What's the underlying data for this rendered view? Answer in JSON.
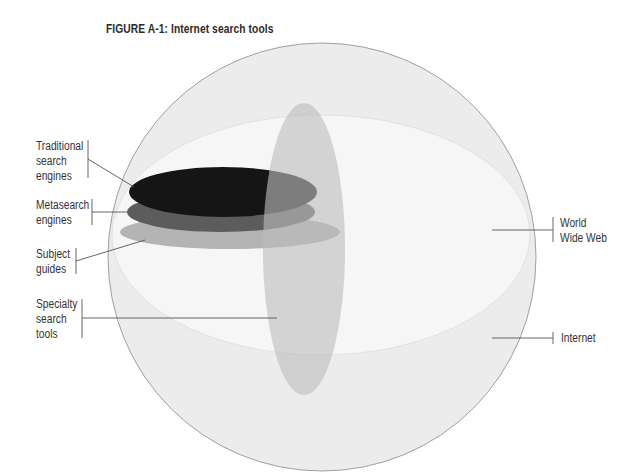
{
  "figure": {
    "title": "FIGURE A-1: Internet search tools"
  },
  "labels": {
    "traditional": [
      "Traditional",
      "search",
      "engines"
    ],
    "metasearch": [
      "Metasearch",
      "engines"
    ],
    "subject": [
      "Subject",
      "guides"
    ],
    "specialty": [
      "Specialty",
      "search",
      "tools"
    ],
    "www": [
      "World",
      "Wide Web"
    ],
    "internet": [
      "Internet"
    ]
  },
  "colors": {
    "internet_fill": "#ececec",
    "www_fill": "#f5f5f5",
    "specialty_fill": "#c9c9c9",
    "traditional_fill": "#161616",
    "metasearch_fill": "#5e5e5e",
    "subject_fill": "#b3b3b3",
    "stroke": "#8a8a8a",
    "leader": "#555555"
  }
}
